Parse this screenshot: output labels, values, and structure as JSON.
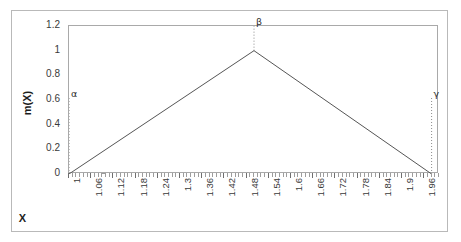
{
  "chart_data": {
    "type": "line",
    "title": "",
    "xlabel": "X",
    "ylabel": "m(X)",
    "xlim": [
      1,
      2
    ],
    "ylim": [
      0,
      1.2
    ],
    "grid": false,
    "legend": null,
    "x_tick_labels": [
      "1",
      "1.06",
      "1.12",
      "1.18",
      "1.24",
      "1.3",
      "1.36",
      "1.42",
      "1.48",
      "1.54",
      "1.6",
      "1.66",
      "1.72",
      "1.78",
      "1.84",
      "1.9",
      "1.96"
    ],
    "x_tick_values": [
      1,
      1.06,
      1.12,
      1.18,
      1.24,
      1.3,
      1.36,
      1.42,
      1.48,
      1.54,
      1.6,
      1.66,
      1.72,
      1.78,
      1.84,
      1.9,
      1.96
    ],
    "x_minor_step": 0.01,
    "y_tick_labels": [
      "1.2",
      "1",
      "0.8",
      "0.6",
      "0.4",
      "0.2",
      "0"
    ],
    "y_tick_values": [
      1.2,
      1,
      0.8,
      0.6,
      0.4,
      0.2,
      0
    ],
    "series": [
      {
        "name": "m(X)",
        "color": "#555555",
        "x": [
          1.0,
          1.5,
          1.98
        ],
        "values": [
          0,
          1,
          0
        ]
      }
    ],
    "annotations": [
      {
        "name": "alpha",
        "label": "α",
        "x": 1.0,
        "y": 0.0,
        "guide_top_y": 0.62,
        "guide_style": "dotted"
      },
      {
        "name": "beta",
        "label": "β",
        "x": 1.5,
        "y": 1.0,
        "guide_top_y": 1.2,
        "guide_style": "dotted"
      },
      {
        "name": "gamma",
        "label": "γ",
        "x": 1.98,
        "y": 0.0,
        "guide_top_y": 0.62,
        "guide_style": "dotted"
      }
    ],
    "colors": {
      "line": "#555555",
      "axis": "#9a9a9a",
      "plot_border": "#a9a9a9",
      "outer_border": "#b9b9b9",
      "guide": "#8c8c8c",
      "text": "#3a3a3a",
      "background": "#ffffff"
    }
  }
}
